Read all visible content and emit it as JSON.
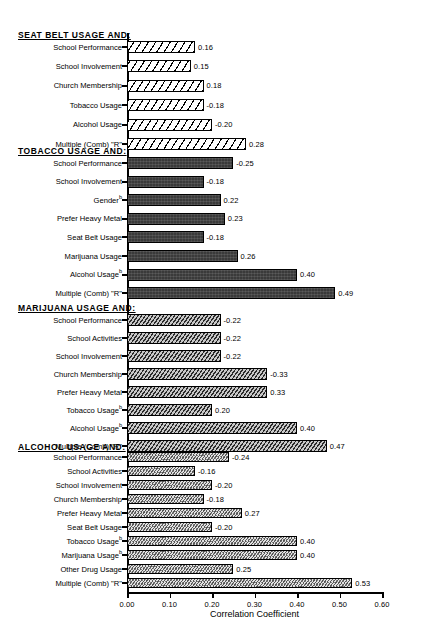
{
  "chart_data": {
    "type": "bar",
    "orientation": "horizontal",
    "title": "",
    "xlabel": "Correlation Coefficient",
    "ylabel": "",
    "xlim": [
      0.0,
      0.6
    ],
    "xticks": [
      "0.00",
      "0.10",
      "0.20",
      "0.30",
      "0.40",
      "0.50",
      "0.60"
    ],
    "xtick_values": [
      0.0,
      0.1,
      0.2,
      0.3,
      0.4,
      0.5,
      0.6
    ],
    "grid": false,
    "legend": "none",
    "note": "Bar lengths encode absolute value of the correlation coefficient; printed labels retain sign.",
    "groups": [
      {
        "header": "SEAT BELT USAGE AND:",
        "pattern": "diagonal-hatch-wide-white",
        "categories": [
          "School Performance",
          "School Involvement",
          "Church Membership",
          "Tobacco Usage",
          "Alcohol Usage",
          "Multiple (Comb) \"R\""
        ],
        "superscripts": [
          "",
          "",
          "",
          "",
          "",
          ""
        ],
        "labels": [
          "0.16",
          "0.15",
          "0.18",
          "-0.18",
          "-0.20",
          "0.28"
        ],
        "values": [
          0.16,
          0.15,
          0.18,
          0.18,
          0.2,
          0.28
        ],
        "signed_values": [
          0.16,
          0.15,
          0.18,
          -0.18,
          -0.2,
          0.28
        ]
      },
      {
        "header": "TOBACCO USAGE AND:",
        "pattern": "solid-dark-gray",
        "categories": [
          "School Performance",
          "School Involvement",
          "Gender",
          "Prefer Heavy Metal",
          "Seat Belt Usage",
          "Marijuana Usage",
          "Alcohol Usage",
          "Multiple (Comb) \"R\""
        ],
        "superscripts": [
          "",
          "",
          "b",
          "",
          "",
          "",
          "b",
          ""
        ],
        "labels": [
          "-0.25",
          "-0.18",
          "0.22",
          "0.23",
          "-0.18",
          "0.26",
          "0.40",
          "0.49"
        ],
        "values": [
          0.25,
          0.18,
          0.22,
          0.23,
          0.18,
          0.26,
          0.4,
          0.49
        ],
        "signed_values": [
          -0.25,
          -0.18,
          0.22,
          0.23,
          -0.18,
          0.26,
          0.4,
          0.49
        ]
      },
      {
        "header": "MARIJUANA USAGE AND:",
        "pattern": "diagonal-hatch-dense-gray",
        "categories": [
          "School Performance",
          "School Activities",
          "School Involvement",
          "Church Membership",
          "Prefer Heavy Metal",
          "Tobacco Usage",
          "Alcohol Usage",
          "Multiple (Comb) \"R\""
        ],
        "superscripts": [
          "",
          "",
          "",
          "",
          "",
          "b",
          "b",
          ""
        ],
        "labels": [
          "-0.22",
          "-0.22",
          "-0.22",
          "-0.33",
          "0.33",
          "0.20",
          "0.40",
          "0.47"
        ],
        "values": [
          0.22,
          0.22,
          0.22,
          0.33,
          0.33,
          0.2,
          0.4,
          0.47
        ],
        "signed_values": [
          -0.22,
          -0.22,
          -0.22,
          -0.33,
          0.33,
          0.2,
          0.4,
          0.47
        ]
      },
      {
        "header": "ALCOHOL USAGE AND:",
        "pattern": "dotted-stipple-light",
        "categories": [
          "School Performance",
          "School Activities",
          "School Involvement",
          "Church Membership",
          "Prefer Heavy Metal",
          "Seat Belt Usage",
          "Tobacco Usage",
          "Marijuana Usage",
          "Other Drug Usage",
          "Multiple (Comb) \"R\""
        ],
        "superscripts": [
          "",
          "",
          "",
          "",
          "",
          "",
          "b",
          "b",
          "",
          ""
        ],
        "labels": [
          "-0.24",
          "-0.16",
          "-0.20",
          "-0.18",
          "0.27",
          "-0.20",
          "0.40",
          "0.40",
          "0.25",
          "0.53"
        ],
        "values": [
          0.24,
          0.16,
          0.2,
          0.18,
          0.27,
          0.2,
          0.4,
          0.4,
          0.25,
          0.53
        ],
        "signed_values": [
          -0.24,
          -0.16,
          -0.2,
          -0.18,
          0.27,
          -0.2,
          0.4,
          0.4,
          0.25,
          0.53
        ]
      }
    ]
  }
}
